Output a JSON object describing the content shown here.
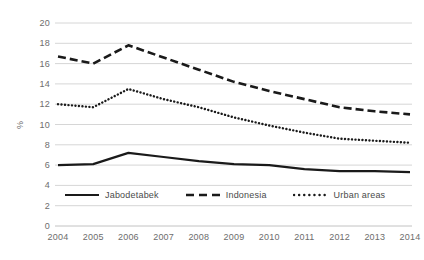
{
  "chart_data": {
    "type": "line",
    "title": "",
    "subtitle": "",
    "xlabel": "",
    "ylabel": "%",
    "ylim": [
      0,
      20
    ],
    "ytick_step": 2,
    "yticks": [
      "0",
      "2",
      "4",
      "6",
      "8",
      "10",
      "12",
      "14",
      "16",
      "18",
      "20"
    ],
    "grid": true,
    "grid_axis": "y",
    "legend_position": "inside-bottom-left",
    "categories": [
      "2004",
      "2005",
      "2006",
      "2007",
      "2008",
      "2009",
      "2010",
      "2011",
      "2012",
      "2013",
      "2014"
    ],
    "x": [
      2004,
      2005,
      2006,
      2007,
      2008,
      2009,
      2010,
      2011,
      2012,
      2013,
      2014
    ],
    "series": [
      {
        "name": "Jabodetabek",
        "style": "solid",
        "color": "#1a1a1a",
        "values": [
          6.0,
          6.1,
          7.2,
          6.8,
          6.4,
          6.1,
          6.0,
          5.6,
          5.4,
          5.4,
          5.3
        ]
      },
      {
        "name": "Indonesia",
        "style": "dashed",
        "color": "#1a1a1a",
        "values": [
          16.7,
          16.0,
          17.8,
          16.6,
          15.4,
          14.2,
          13.3,
          12.5,
          11.7,
          11.3,
          11.0
        ]
      },
      {
        "name": "Urban areas",
        "style": "dotted",
        "color": "#1a1a1a",
        "values": [
          12.0,
          11.7,
          13.5,
          12.5,
          11.7,
          10.7,
          9.9,
          9.2,
          8.6,
          8.4,
          8.2
        ]
      }
    ]
  },
  "axes": {
    "y_title": "%",
    "y_tick_labels": [
      "20",
      "18",
      "16",
      "14",
      "12",
      "10",
      "8",
      "6",
      "4",
      "2",
      "0"
    ],
    "x_tick_labels": [
      "2004",
      "2005",
      "2006",
      "2007",
      "2008",
      "2009",
      "2010",
      "2011",
      "2012",
      "2013",
      "2014"
    ]
  },
  "legend": {
    "items": [
      {
        "label": "Jabodetabek",
        "style": "solid"
      },
      {
        "label": "Indonesia",
        "style": "dashed"
      },
      {
        "label": "Urban areas",
        "style": "dotted"
      }
    ]
  },
  "colors": {
    "line": "#1a1a1a",
    "grid": "#d6d6d6",
    "text": "#6d6d6d",
    "legend_text": "#4a4a4a",
    "background": "#ffffff"
  }
}
